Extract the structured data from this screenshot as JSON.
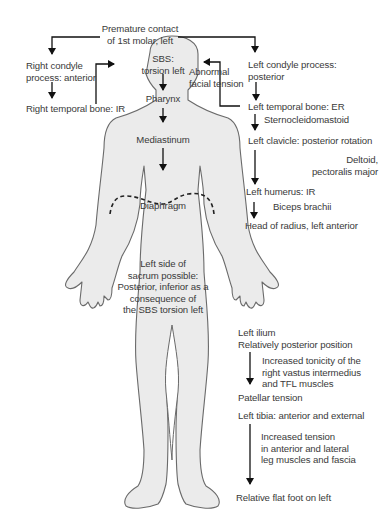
{
  "figure": {
    "colors": {
      "body_fill": "#ebebeb",
      "body_stroke": "#6a6a6a",
      "arrow": "#111111",
      "text": "#3a3a3a"
    },
    "labels": {
      "premature_contact_1": "Premature contact",
      "premature_contact_2": "of 1st molar, left",
      "right_condyle_1": "Right condyle",
      "right_condyle_2": "process: anterior",
      "right_temporal": "Right temporal bone: IR",
      "sbs_1": "SBS:",
      "sbs_2": "torsion left",
      "abnormal_1": "Abnormal",
      "abnormal_2": "facial tension",
      "pharynx": "Pharynx",
      "mediastinum": "Mediastinum",
      "diaphragm": "Diaphragm",
      "sacrum_1": "Left side of",
      "sacrum_2": "sacrum possible:",
      "sacrum_3": "Posterior, inferior as a",
      "sacrum_4": "consequence of",
      "sacrum_5": "the SBS torsion left",
      "left_condyle_1": "Left condyle process:",
      "left_condyle_2": "posterior",
      "left_temporal": "Left temporal bone: ER",
      "scm": "Sternocleidomastoid",
      "left_clavicle": "Left clavicle: posterior rotation",
      "deltoid_1": "Deltoid,",
      "deltoid_2": "pectoralis major",
      "left_humerus": "Left humerus: IR",
      "biceps": "Biceps brachii",
      "radius": "Head of radius, left anterior",
      "ilium_1": "Left ilium",
      "ilium_2": "Relatively posterior position",
      "tonicity_1": "Increased tonicity of the",
      "tonicity_2": "right vastus intermedius",
      "tonicity_3": "and TFL muscles",
      "patellar": "Patellar tension",
      "tibia": "Left tibia: anterior and external",
      "tension_1": "Increased tension",
      "tension_2": "in anterior and lateral",
      "tension_3": "leg muscles and fascia",
      "flatfoot": "Relative flat foot on left"
    }
  }
}
